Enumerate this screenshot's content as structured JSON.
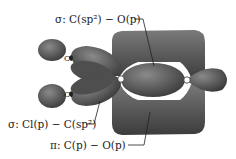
{
  "diagram": {
    "labels": {
      "sigma_co": "σ: C(sp²) − O(p)",
      "sigma_clc": "σ: Cl(p) − C(sp²)",
      "pi_co": "π: C(p) − O(p)"
    },
    "atoms": {
      "cl_top": "Cl",
      "cl_bottom": "Cl"
    },
    "colors": {
      "lobe": "#5a5a5a",
      "lobe_dark": "#3e3e3e",
      "lobe_highlight": "#8a8a8a",
      "leader": "#222222"
    }
  }
}
